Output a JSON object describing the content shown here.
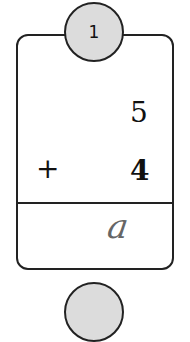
{
  "problem": {
    "number": "1",
    "first_addend": "5",
    "operator": "+",
    "second_addend": "4",
    "handwritten_answer": "a"
  },
  "next_problem": {
    "number": ""
  }
}
